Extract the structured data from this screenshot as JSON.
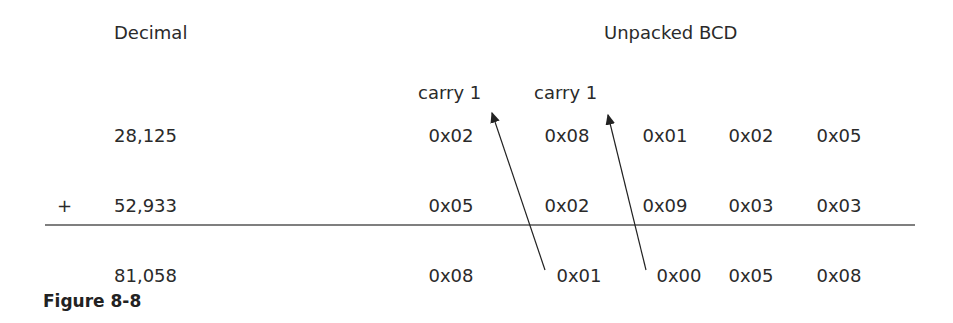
{
  "headers": {
    "decimal": "Decimal",
    "bcd": "Unpacked BCD"
  },
  "carries": [
    "carry 1",
    "carry 1"
  ],
  "operator": "+",
  "rows": [
    {
      "decimal": "28,125",
      "bcd": [
        "0x02",
        "0x08",
        "0x01",
        "0x02",
        "0x05"
      ]
    },
    {
      "decimal": "52,933",
      "bcd": [
        "0x05",
        "0x02",
        "0x09",
        "0x03",
        "0x03"
      ]
    },
    {
      "decimal": "81,058",
      "bcd": [
        "0x08",
        "0x01",
        "0x00",
        "0x05",
        "0x08"
      ]
    }
  ],
  "caption": "Figure 8-8"
}
